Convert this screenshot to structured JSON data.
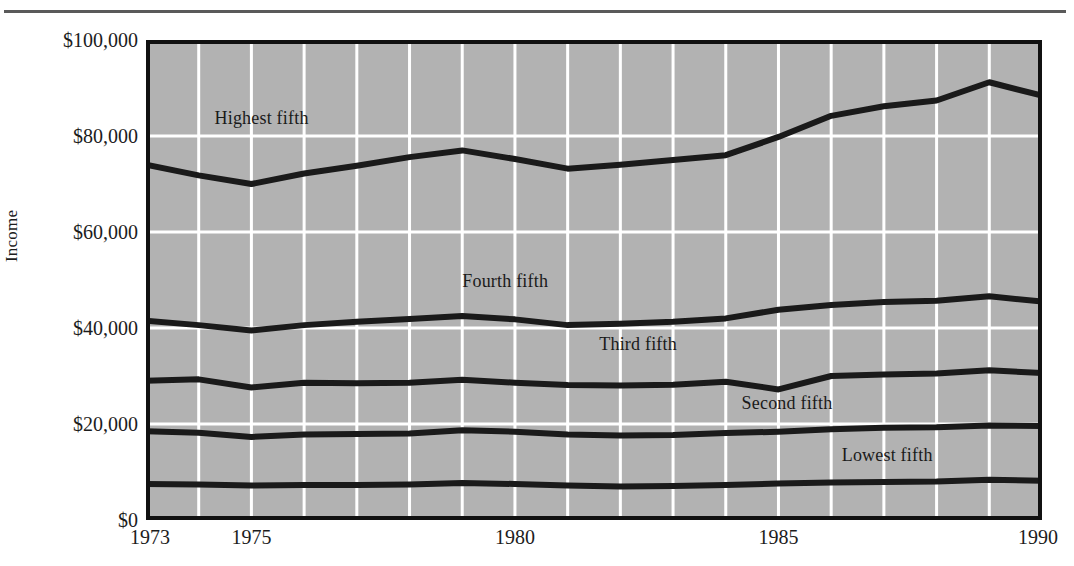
{
  "figure": {
    "axis_title_y": "Income",
    "plot_background_color": "#b2b2b2",
    "gridline_color": "#ffffff",
    "line_color": "#1a1a1a",
    "border_color": "#111111"
  },
  "axes": {
    "y_ticks": [
      "$0",
      "$20,000",
      "$40,000",
      "$60,000",
      "$80,000",
      "$100,000"
    ],
    "y_tick_values": [
      0,
      20000,
      40000,
      60000,
      80000,
      100000
    ],
    "x_ticks": [
      "1973",
      "1975",
      "1980",
      "1985",
      "1990"
    ],
    "x_tick_values": [
      1973,
      1975,
      1980,
      1985,
      1990
    ]
  },
  "series_labels": [
    {
      "text": "Highest fifth",
      "x": 1974.3,
      "y": 83500
    },
    {
      "text": "Fourth fifth",
      "x": 1979.0,
      "y": 49500
    },
    {
      "text": "Third fifth",
      "x": 1981.6,
      "y": 36500
    },
    {
      "text": "Second fifth",
      "x": 1984.3,
      "y": 24200
    },
    {
      "text": "Lowest fifth",
      "x": 1986.2,
      "y": 13400
    }
  ],
  "chart_data": {
    "type": "line",
    "title": "",
    "xlabel": "",
    "ylabel": "Income",
    "xlim": [
      1973,
      1990
    ],
    "ylim": [
      0,
      100000
    ],
    "grid": true,
    "legend": "inline-labels",
    "x": [
      1973,
      1974,
      1975,
      1976,
      1977,
      1978,
      1979,
      1980,
      1981,
      1982,
      1983,
      1984,
      1985,
      1986,
      1987,
      1988,
      1989,
      1990
    ],
    "series": [
      {
        "name": "Highest fifth",
        "values": [
          74000,
          71800,
          70000,
          72200,
          73800,
          75600,
          77000,
          75200,
          73200,
          74000,
          75000,
          76000,
          79800,
          84200,
          86200,
          87400,
          91200,
          88400
        ]
      },
      {
        "name": "Fourth fifth",
        "values": [
          41500,
          40600,
          39500,
          40600,
          41300,
          41900,
          42500,
          41800,
          40600,
          40900,
          41300,
          42000,
          43800,
          44800,
          45400,
          45700,
          46600,
          45500
        ]
      },
      {
        "name": "Third fifth",
        "values": [
          29000,
          29300,
          27600,
          28600,
          28500,
          28600,
          29200,
          28600,
          28100,
          28000,
          28200,
          28800,
          27200,
          30000,
          30300,
          30500,
          31200,
          30600
        ]
      },
      {
        "name": "Second fifth",
        "values": [
          18500,
          18200,
          17300,
          17800,
          17900,
          18000,
          18700,
          18400,
          17800,
          17600,
          17700,
          18100,
          18400,
          18900,
          19200,
          19300,
          19700,
          19600
        ]
      },
      {
        "name": "Lowest fifth",
        "values": [
          7500,
          7400,
          7200,
          7300,
          7300,
          7400,
          7700,
          7500,
          7200,
          7000,
          7100,
          7300,
          7600,
          7800,
          7900,
          8000,
          8400,
          8200
        ]
      }
    ]
  }
}
